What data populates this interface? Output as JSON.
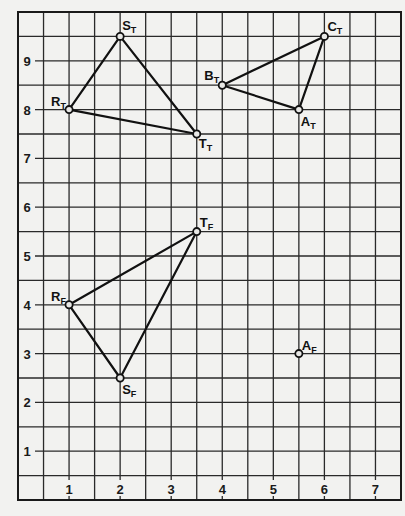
{
  "figure": {
    "x_range": [
      0,
      7.5
    ],
    "y_range": [
      0,
      10
    ],
    "grid_step": 0.5,
    "x_tick_labels": [
      "1",
      "2",
      "3",
      "4",
      "5",
      "6",
      "7"
    ],
    "y_tick_labels": [
      "1",
      "2",
      "3",
      "4",
      "5",
      "6",
      "7",
      "8",
      "9"
    ]
  },
  "points": [
    {
      "name": "R",
      "sub": "T",
      "x": 1,
      "y": 8,
      "dx": -18,
      "dy": -4
    },
    {
      "name": "S",
      "sub": "T",
      "x": 2,
      "y": 9.5,
      "dx": 2,
      "dy": -6
    },
    {
      "name": "T",
      "sub": "T",
      "x": 3.5,
      "y": 7.5,
      "dx": 2,
      "dy": 14
    },
    {
      "name": "B",
      "sub": "T",
      "x": 4,
      "y": 8.5,
      "dx": -18,
      "dy": -5
    },
    {
      "name": "C",
      "sub": "T",
      "x": 6,
      "y": 9.5,
      "dx": 3,
      "dy": -5
    },
    {
      "name": "A",
      "sub": "T",
      "x": 5.5,
      "y": 8,
      "dx": 2,
      "dy": 16
    },
    {
      "name": "T",
      "sub": "F",
      "x": 3.5,
      "y": 5.5,
      "dx": 3,
      "dy": -5
    },
    {
      "name": "R",
      "sub": "F",
      "x": 1,
      "y": 4,
      "dx": -18,
      "dy": -4
    },
    {
      "name": "S",
      "sub": "F",
      "x": 2,
      "y": 2.5,
      "dx": 2,
      "dy": 16
    },
    {
      "name": "A",
      "sub": "F",
      "x": 5.5,
      "y": 3,
      "dx": 3,
      "dy": -4
    }
  ],
  "triangles": [
    {
      "label": "R_T S_T T_T",
      "vertices": [
        [
          1,
          8
        ],
        [
          2,
          9.5
        ],
        [
          3.5,
          7.5
        ]
      ]
    },
    {
      "label": "B_T C_T A_T",
      "vertices": [
        [
          4,
          8.5
        ],
        [
          6,
          9.5
        ],
        [
          5.5,
          8
        ]
      ]
    },
    {
      "label": "R_F T_F S_F",
      "vertices": [
        [
          1,
          4
        ],
        [
          3.5,
          5.5
        ],
        [
          2,
          2.5
        ]
      ]
    }
  ]
}
